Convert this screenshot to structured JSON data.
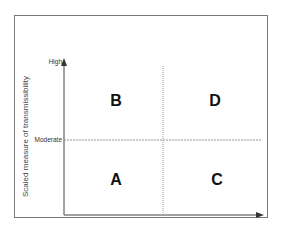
{
  "diagram": {
    "y_axis_label": "Scaled measure of transmissibility",
    "y_ticks": {
      "high": "High",
      "moderate": "Moderate"
    },
    "quadrants": {
      "top_left": "B",
      "top_right": "D",
      "bottom_left": "A",
      "bottom_right": "C"
    },
    "colors": {
      "axis": "#444444",
      "divider": "#9a9a9a",
      "frame": "#7a7a7a"
    }
  }
}
